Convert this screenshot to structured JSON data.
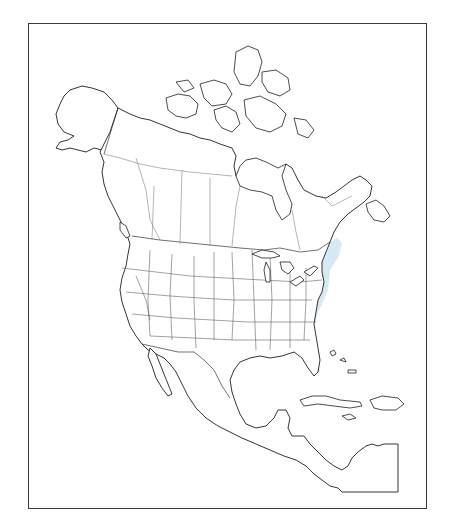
{
  "map": {
    "type": "species-range-map",
    "region": "North America",
    "frame": {
      "x": 28,
      "y": 23,
      "width": 399,
      "height": 486
    },
    "colors": {
      "background": "#ffffff",
      "outline": "#1e1e1e",
      "range_fill": "#d4e9f2",
      "frame": "#3a3a3a"
    },
    "legend": [],
    "labels": [],
    "range_areas": [
      {
        "name": "eastern-central-united-states",
        "description": "Great Plains east to Atlantic coast, south to Gulf coast and south Texas, north to southern Canada"
      },
      {
        "name": "pacific-northwest",
        "description": "Southern British Columbia / Washington / northern Idaho"
      },
      {
        "name": "california",
        "description": "Central California interior"
      },
      {
        "name": "great-basin-patch",
        "description": "Utah / Colorado lobe"
      }
    ]
  }
}
